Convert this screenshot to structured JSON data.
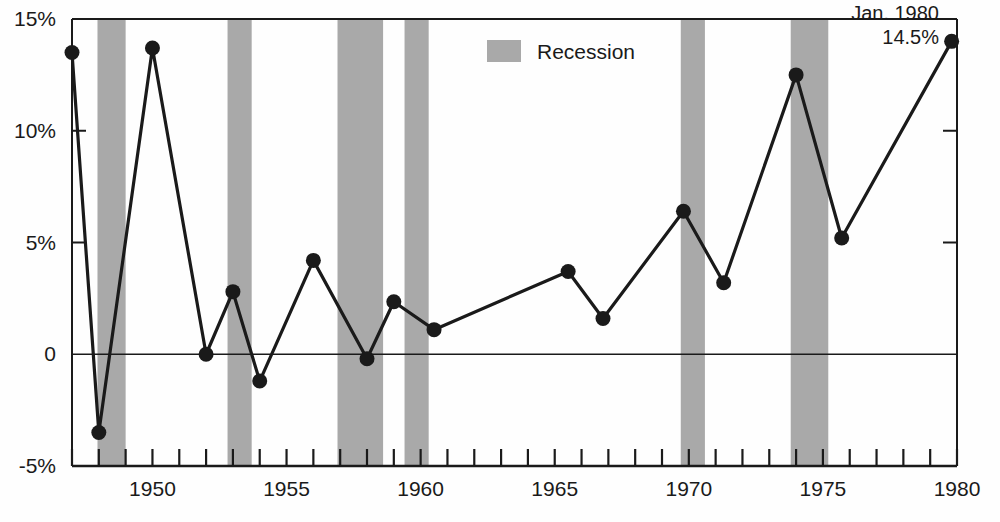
{
  "chart_data": {
    "type": "line",
    "title": "",
    "xlabel": "",
    "ylabel": "",
    "xlim": [
      1947,
      1980
    ],
    "ylim": [
      -5,
      15
    ],
    "grid": false,
    "legend_position": "top-center",
    "y_ticks": [
      {
        "value": 15,
        "label": "15%"
      },
      {
        "value": 10,
        "label": "10%"
      },
      {
        "value": 5,
        "label": "5%"
      },
      {
        "value": 0,
        "label": "0"
      },
      {
        "value": -5,
        "label": "-5%"
      }
    ],
    "x_ticks": [
      {
        "value": 1947,
        "label": ""
      },
      {
        "value": 1948,
        "label": ""
      },
      {
        "value": 1949,
        "label": ""
      },
      {
        "value": 1950,
        "label": "1950"
      },
      {
        "value": 1951,
        "label": ""
      },
      {
        "value": 1952,
        "label": ""
      },
      {
        "value": 1953,
        "label": ""
      },
      {
        "value": 1954,
        "label": ""
      },
      {
        "value": 1955,
        "label": "1955"
      },
      {
        "value": 1956,
        "label": ""
      },
      {
        "value": 1957,
        "label": ""
      },
      {
        "value": 1958,
        "label": ""
      },
      {
        "value": 1959,
        "label": ""
      },
      {
        "value": 1960,
        "label": "1960"
      },
      {
        "value": 1961,
        "label": ""
      },
      {
        "value": 1962,
        "label": ""
      },
      {
        "value": 1963,
        "label": ""
      },
      {
        "value": 1964,
        "label": ""
      },
      {
        "value": 1965,
        "label": "1965"
      },
      {
        "value": 1966,
        "label": ""
      },
      {
        "value": 1967,
        "label": ""
      },
      {
        "value": 1968,
        "label": ""
      },
      {
        "value": 1969,
        "label": ""
      },
      {
        "value": 1970,
        "label": "1970"
      },
      {
        "value": 1971,
        "label": ""
      },
      {
        "value": 1972,
        "label": ""
      },
      {
        "value": 1973,
        "label": ""
      },
      {
        "value": 1974,
        "label": ""
      },
      {
        "value": 1975,
        "label": "1975"
      },
      {
        "value": 1976,
        "label": ""
      },
      {
        "value": 1977,
        "label": ""
      },
      {
        "value": 1978,
        "label": ""
      },
      {
        "value": 1979,
        "label": ""
      },
      {
        "value": 1980,
        "label": "1980"
      }
    ],
    "series": [
      {
        "name": "Inflation rate",
        "color": "#1a1a1a",
        "marker": "circle",
        "x": [
          1947,
          1948,
          1950,
          1952,
          1953,
          1954,
          1956,
          1958,
          1959,
          1960.5,
          1965.5,
          1966.8,
          1969.8,
          1971.3,
          1974,
          1975.7,
          1979.8
        ],
        "values": [
          13.5,
          -3.5,
          13.7,
          0.0,
          2.8,
          -1.2,
          4.2,
          -0.2,
          2.35,
          1.1,
          3.7,
          1.6,
          6.4,
          3.2,
          12.5,
          5.2,
          14.0
        ]
      }
    ],
    "recession_bands": [
      {
        "start": 1947.95,
        "end": 1949.0
      },
      {
        "start": 1952.8,
        "end": 1953.7
      },
      {
        "start": 1956.9,
        "end": 1958.6
      },
      {
        "start": 1959.4,
        "end": 1960.3
      },
      {
        "start": 1969.7,
        "end": 1970.6
      },
      {
        "start": 1973.8,
        "end": 1975.2
      }
    ],
    "legend": [
      {
        "label": "Recession",
        "color": "#a9a9a9",
        "type": "swatch"
      }
    ],
    "annotations": [
      {
        "line1": "Jan. 1980",
        "line2": "14.5%",
        "x": 1980,
        "y": 14.5
      }
    ]
  },
  "colors": {
    "line": "#1a1a1a",
    "recession": "#a9a9a9",
    "axis": "#1a1a1a",
    "background": "#ffffff"
  }
}
